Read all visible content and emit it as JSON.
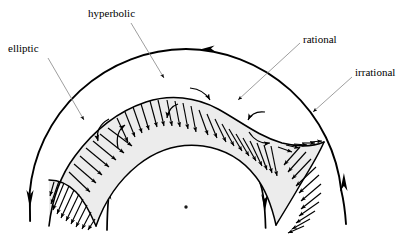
{
  "figure": {
    "type": "diagram",
    "background_color": "#ffffff",
    "stroke_color": "#000000",
    "hatch_fill_color": "#ededed",
    "leader_line_color": "#8a8a8a",
    "labels": [
      {
        "id": "elliptic",
        "text": "elliptic",
        "x": 8,
        "y": 43,
        "leader_from": [
          48,
          57
        ],
        "leader_to": [
          86,
          122
        ]
      },
      {
        "id": "hyperbolic",
        "text": "hyperbolic",
        "x": 88,
        "y": 8,
        "leader_from": [
          130,
          22
        ],
        "leader_to": [
          166,
          80
        ]
      },
      {
        "id": "rational",
        "text": "rational",
        "x": 303,
        "y": 34,
        "leader_from": [
          300,
          42
        ],
        "leader_to": [
          236,
          101
        ]
      },
      {
        "id": "irrational",
        "text": "irrational",
        "x": 355,
        "y": 67,
        "leader_from": [
          352,
          76
        ],
        "leader_to": [
          311,
          113
        ]
      }
    ],
    "arcs": [
      {
        "id": "outer-arc",
        "name": "irrational-invariant-curve-outer",
        "center": [
          186,
          207
        ],
        "radius": 158,
        "start_angle_deg": 185,
        "end_angle_deg": 357,
        "arrow_at_top": "leftward",
        "arrow_at_left_end": "downward",
        "arrow_at_right_end": "upward"
      },
      {
        "id": "inner-arc",
        "name": "invariant-curve-inner",
        "center": [
          186,
          207
        ],
        "radius": 78,
        "start_angle_deg": 183,
        "end_angle_deg": 358,
        "arrow_at_top": "rightward",
        "arrow_at_left_end": "upward",
        "arrow_at_right_end": "downward"
      }
    ],
    "center_point": {
      "x": 186,
      "y": 207,
      "radius": 1.6
    },
    "ribbon": {
      "name": "rational-torus-resonance-band",
      "description": "S-shaped hatched band with arrow-tipped transversal ticks, lying between the inner and outer invariant curves",
      "tick_count": 52,
      "hyperbolic_points": [
        [
          166,
          128
        ],
        [
          243,
          134
        ]
      ],
      "elliptic_points": [
        [
          118,
          160
        ],
        [
          205,
          108
        ],
        [
          290,
          170
        ]
      ]
    },
    "small_rotation_arrows": [
      {
        "id": "rot-1",
        "center": [
          101,
          133
        ],
        "direction": "counterclockwise"
      },
      {
        "id": "rot-2",
        "center": [
          122,
          127
        ],
        "direction": "clockwise"
      },
      {
        "id": "rot-3",
        "center": [
          169,
          111
        ],
        "direction": "clockwise"
      },
      {
        "id": "rot-4",
        "center": [
          196,
          95
        ],
        "direction": "counterclockwise"
      },
      {
        "id": "rot-5",
        "center": [
          255,
          116
        ],
        "direction": "clockwise"
      },
      {
        "id": "rot-6",
        "center": [
          261,
          135
        ],
        "direction": "counterclockwise"
      }
    ]
  }
}
